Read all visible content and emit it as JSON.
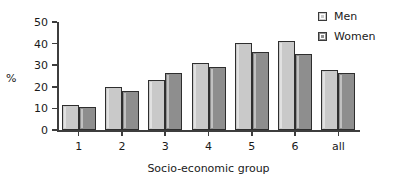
{
  "chart_data": {
    "type": "bar",
    "title": "",
    "subtitle": "",
    "xlabel": "Socio-economic group",
    "ylabel": "%",
    "categories": [
      "1",
      "2",
      "3",
      "4",
      "5",
      "6",
      "all"
    ],
    "series": [
      {
        "name": "Men",
        "color": "#c9c9c9",
        "values": [
          11.5,
          20,
          23,
          31,
          40.5,
          41,
          28
        ]
      },
      {
        "name": "Women",
        "color": "#8e8e8e",
        "values": [
          10.5,
          18,
          26.5,
          29,
          36,
          35,
          26.5
        ]
      }
    ],
    "ylim": [
      0,
      50
    ],
    "ytick_labels": [
      "50",
      "40",
      "30",
      "20",
      "10",
      "0"
    ],
    "ytick_values": [
      50,
      40,
      30,
      20,
      10,
      0
    ],
    "grid": false,
    "legend_position": "top-right"
  },
  "legend": {
    "items": [
      {
        "label": "Men",
        "swatch": "light-gray-swatch-icon"
      },
      {
        "label": "Women",
        "swatch": "dark-gray-swatch-icon"
      }
    ]
  },
  "axes": {
    "y_title": "%",
    "x_title": "Socio-economic group"
  }
}
